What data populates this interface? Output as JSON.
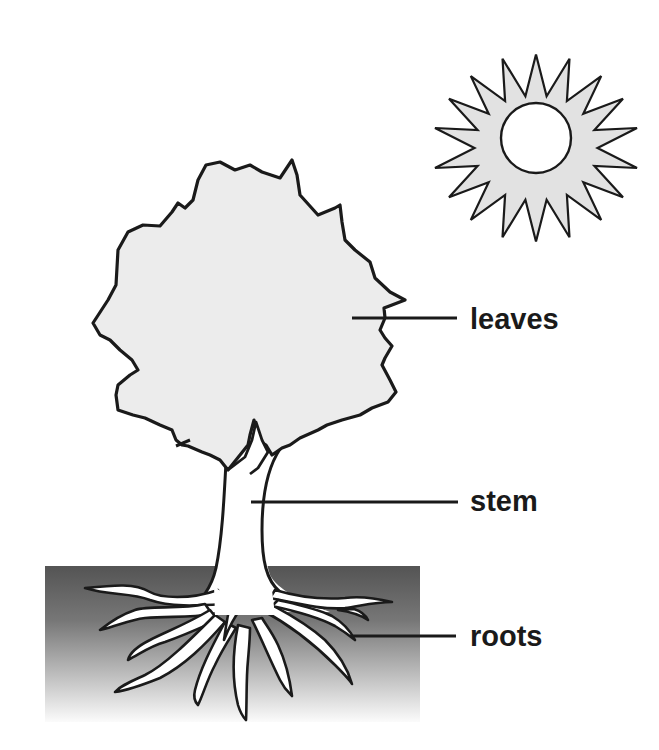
{
  "diagram": {
    "title": "",
    "labels": [
      {
        "id": "leaves",
        "text": "leaves"
      },
      {
        "id": "stem",
        "text": "stem"
      },
      {
        "id": "roots",
        "text": "roots"
      }
    ],
    "elements": [
      "sun-icon",
      "tree-crown",
      "tree-trunk",
      "soil",
      "roots"
    ],
    "colors": {
      "outline": "#1a1a1a",
      "crown_fill": "#ececec",
      "sun_ray_fill": "#e2e2e2",
      "sun_core_fill": "#ffffff",
      "soil_top": "#545454",
      "soil_bottom": "#ffffff",
      "background": "#ffffff"
    }
  }
}
